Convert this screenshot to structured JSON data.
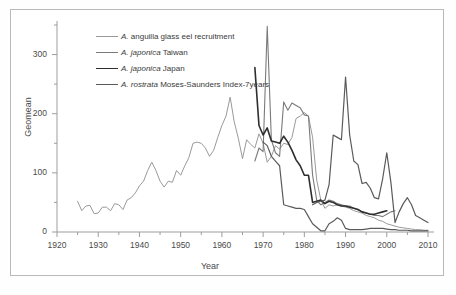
{
  "chart_data": {
    "type": "line",
    "title": "",
    "xlabel": "Year",
    "ylabel": "Geomean",
    "xlim": [
      1920,
      2010
    ],
    "ylim": [
      0,
      350
    ],
    "xticks": [
      1920,
      1930,
      1940,
      1950,
      1960,
      1970,
      1980,
      1990,
      2000,
      2010
    ],
    "yticks": [
      0,
      100,
      200,
      300
    ],
    "minor_xtick_interval": 5,
    "minor_ytick_interval": 50,
    "grid": false,
    "legend_position": "upper-left-inside",
    "series": [
      {
        "name": "A. anguilla glass eel recruitment",
        "color": "#9a9a9a",
        "width": 1.0,
        "points": [
          [
            1925,
            52
          ],
          [
            1926,
            36
          ],
          [
            1927,
            44
          ],
          [
            1928,
            45
          ],
          [
            1929,
            31
          ],
          [
            1930,
            32
          ],
          [
            1931,
            42
          ],
          [
            1932,
            42
          ],
          [
            1933,
            36
          ],
          [
            1934,
            48
          ],
          [
            1935,
            46
          ],
          [
            1936,
            38
          ],
          [
            1937,
            54
          ],
          [
            1938,
            58
          ],
          [
            1939,
            66
          ],
          [
            1940,
            78
          ],
          [
            1941,
            86
          ],
          [
            1942,
            104
          ],
          [
            1943,
            118
          ],
          [
            1944,
            104
          ],
          [
            1945,
            86
          ],
          [
            1946,
            76
          ],
          [
            1947,
            86
          ],
          [
            1948,
            84
          ],
          [
            1949,
            104
          ],
          [
            1950,
            96
          ],
          [
            1951,
            112
          ],
          [
            1952,
            126
          ],
          [
            1953,
            150
          ],
          [
            1954,
            152
          ],
          [
            1955,
            150
          ],
          [
            1956,
            142
          ],
          [
            1957,
            128
          ],
          [
            1958,
            138
          ],
          [
            1959,
            160
          ],
          [
            1960,
            180
          ],
          [
            1961,
            196
          ],
          [
            1962,
            228
          ],
          [
            1963,
            186
          ],
          [
            1964,
            158
          ],
          [
            1965,
            124
          ],
          [
            1966,
            156
          ],
          [
            1967,
            148
          ],
          [
            1968,
            142
          ],
          [
            1969,
            166
          ],
          [
            1970,
            150
          ],
          [
            1971,
            118
          ],
          [
            1972,
            128
          ],
          [
            1973,
            146
          ],
          [
            1974,
            140
          ],
          [
            1975,
            150
          ],
          [
            1976,
            148
          ],
          [
            1977,
            160
          ],
          [
            1978,
            192
          ],
          [
            1979,
            196
          ],
          [
            1980,
            202
          ],
          [
            1981,
            196
          ],
          [
            1982,
            160
          ],
          [
            1983,
            88
          ],
          [
            1984,
            54
          ],
          [
            1985,
            40
          ],
          [
            1986,
            46
          ],
          [
            1987,
            44
          ],
          [
            1988,
            46
          ],
          [
            1989,
            44
          ],
          [
            1990,
            42
          ],
          [
            1991,
            40
          ],
          [
            1992,
            36
          ],
          [
            1993,
            34
          ],
          [
            1994,
            32
          ],
          [
            1995,
            28
          ],
          [
            1996,
            26
          ],
          [
            1997,
            24
          ],
          [
            1998,
            20
          ],
          [
            1999,
            18
          ],
          [
            2000,
            14
          ],
          [
            2001,
            12
          ],
          [
            2002,
            10
          ],
          [
            2003,
            8
          ],
          [
            2004,
            7
          ],
          [
            2005,
            6
          ],
          [
            2006,
            5
          ],
          [
            2007,
            4
          ],
          [
            2008,
            4
          ],
          [
            2009,
            3
          ],
          [
            2010,
            3
          ]
        ]
      },
      {
        "name": "A. japonica Taiwan",
        "color": "#7a7a7a",
        "width": 1.1,
        "points": [
          [
            1968,
            120
          ],
          [
            1969,
            142
          ],
          [
            1970,
            136
          ],
          [
            1971,
            348
          ],
          [
            1972,
            156
          ],
          [
            1973,
            134
          ],
          [
            1974,
            128
          ],
          [
            1975,
            220
          ],
          [
            1976,
            206
          ],
          [
            1977,
            218
          ],
          [
            1978,
            214
          ],
          [
            1979,
            210
          ],
          [
            1980,
            198
          ],
          [
            1981,
            196
          ],
          [
            1982,
            96
          ],
          [
            1983,
            54
          ],
          [
            1984,
            46
          ],
          [
            1985,
            50
          ],
          [
            1986,
            54
          ],
          [
            1987,
            52
          ],
          [
            1988,
            48
          ],
          [
            1989,
            46
          ],
          [
            1990,
            44
          ],
          [
            1991,
            44
          ],
          [
            1992,
            40
          ],
          [
            1993,
            38
          ],
          [
            1994,
            34
          ],
          [
            1995,
            32
          ],
          [
            1996,
            30
          ],
          [
            1997,
            28
          ],
          [
            1998,
            28
          ],
          [
            1999,
            26
          ],
          [
            2000,
            30
          ],
          [
            2001,
            34
          ],
          [
            2002,
            36
          ]
        ]
      },
      {
        "name": "A. japonica Japan",
        "color": "#2e2e2e",
        "width": 1.6,
        "points": [
          [
            1968,
            278
          ],
          [
            1969,
            180
          ],
          [
            1970,
            164
          ],
          [
            1971,
            176
          ],
          [
            1972,
            154
          ],
          [
            1973,
            152
          ],
          [
            1974,
            150
          ],
          [
            1975,
            162
          ],
          [
            1976,
            152
          ],
          [
            1977,
            138
          ],
          [
            1978,
            122
          ],
          [
            1979,
            112
          ],
          [
            1980,
            96
          ],
          [
            1981,
            96
          ],
          [
            1982,
            50
          ],
          [
            1983,
            52
          ],
          [
            1984,
            54
          ],
          [
            1985,
            48
          ],
          [
            1986,
            52
          ],
          [
            1987,
            50
          ],
          [
            1988,
            46
          ],
          [
            1989,
            44
          ],
          [
            1990,
            44
          ],
          [
            1991,
            42
          ],
          [
            1992,
            40
          ],
          [
            1993,
            38
          ],
          [
            1994,
            34
          ],
          [
            1995,
            32
          ],
          [
            1996,
            30
          ],
          [
            1997,
            30
          ],
          [
            1998,
            32
          ],
          [
            1999,
            34
          ],
          [
            2000,
            36
          ]
        ]
      },
      {
        "name": "A. rostrata Moses-Saunders Index-7years",
        "color": "#5a5a5a",
        "width": 1.2,
        "points": [
          [
            1970,
            152
          ],
          [
            1971,
            146
          ],
          [
            1972,
            128
          ],
          [
            1973,
            120
          ],
          [
            1974,
            112
          ],
          [
            1975,
            46
          ],
          [
            1976,
            44
          ],
          [
            1977,
            42
          ],
          [
            1978,
            40
          ],
          [
            1979,
            40
          ],
          [
            1980,
            38
          ],
          [
            1981,
            26
          ],
          [
            1982,
            14
          ],
          [
            1983,
            8
          ],
          [
            1984,
            2
          ],
          [
            1985,
            2
          ],
          [
            1986,
            14
          ],
          [
            1987,
            18
          ],
          [
            1988,
            24
          ],
          [
            1989,
            20
          ],
          [
            1990,
            6
          ],
          [
            1991,
            4
          ],
          [
            1992,
            4
          ],
          [
            1993,
            4
          ],
          [
            1994,
            4
          ],
          [
            1995,
            5
          ],
          [
            1996,
            6
          ],
          [
            1997,
            6
          ],
          [
            1998,
            6
          ],
          [
            1999,
            6
          ],
          [
            2000,
            5
          ],
          [
            2001,
            4
          ],
          [
            2002,
            4
          ],
          [
            2003,
            3
          ],
          [
            2004,
            3
          ],
          [
            2005,
            3
          ],
          [
            2006,
            2
          ],
          [
            2007,
            2
          ],
          [
            2008,
            2
          ],
          [
            2009,
            2
          ],
          [
            2010,
            2
          ]
        ]
      },
      {
        "name": "A. rostrata Moses-Saunders upper",
        "color": "#5a5a5a",
        "width": 1.2,
        "points": [
          [
            1982,
            46
          ],
          [
            1983,
            50
          ],
          [
            1984,
            52
          ],
          [
            1985,
            54
          ],
          [
            1986,
            80
          ],
          [
            1987,
            164
          ],
          [
            1988,
            160
          ],
          [
            1989,
            156
          ],
          [
            1990,
            262
          ],
          [
            1991,
            164
          ],
          [
            1992,
            120
          ],
          [
            1993,
            114
          ],
          [
            1994,
            82
          ],
          [
            1995,
            84
          ],
          [
            1996,
            74
          ],
          [
            1997,
            58
          ],
          [
            1998,
            56
          ],
          [
            1999,
            90
          ],
          [
            2000,
            134
          ],
          [
            2001,
            84
          ],
          [
            2002,
            16
          ],
          [
            2003,
            34
          ],
          [
            2004,
            48
          ],
          [
            2005,
            58
          ],
          [
            2006,
            46
          ],
          [
            2007,
            28
          ],
          [
            2008,
            24
          ],
          [
            2009,
            20
          ],
          [
            2010,
            16
          ]
        ]
      }
    ]
  },
  "legend": {
    "items": [
      {
        "label_italic": "A.",
        "label_rest": " anguilla glass eel recruitment",
        "color": "#9a9a9a",
        "width": 1.0
      },
      {
        "label_italic": "A. japonica",
        "label_rest": " Taiwan",
        "color": "#7a7a7a",
        "width": 1.1
      },
      {
        "label_italic": "A. japonica",
        "label_rest": " Japan",
        "color": "#2e2e2e",
        "width": 1.8
      },
      {
        "label_italic": "A. rostrata",
        "label_rest": " Moses-Saunders Index-7years",
        "color": "#5a5a5a",
        "width": 1.2
      }
    ]
  },
  "axes": {
    "ylabel": "Geomean",
    "xlabel": "Year",
    "yticks": [
      "300",
      "200",
      "100",
      "0"
    ],
    "xticks": [
      "1920",
      "1930",
      "1940",
      "1950",
      "1960",
      "1970",
      "1980",
      "1990",
      "2000",
      "2010"
    ]
  }
}
